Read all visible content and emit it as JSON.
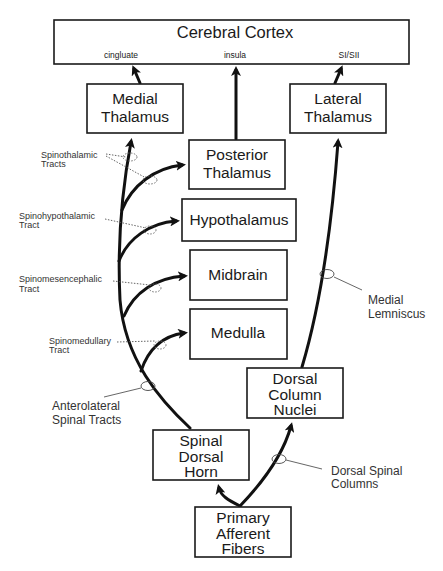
{
  "diagram": {
    "boxes": {
      "cortex": {
        "label": "Cerebral Cortex",
        "regions": [
          "cingluate",
          "insula",
          "SI/SII"
        ]
      },
      "medial_thalamus": {
        "lines": [
          "Medial",
          "Thalamus"
        ]
      },
      "lateral_thalamus": {
        "lines": [
          "Lateral",
          "Thalamus"
        ]
      },
      "posterior_thalamus": {
        "lines": [
          "Posterior",
          "Thalamus"
        ]
      },
      "hypothalamus": {
        "lines": [
          "Hypothalamus"
        ]
      },
      "midbrain": {
        "lines": [
          "Midbrain"
        ]
      },
      "medulla": {
        "lines": [
          "Medulla"
        ]
      },
      "dorsal_column_nuclei": {
        "lines": [
          "Dorsal",
          "Column",
          "Nuclei"
        ]
      },
      "spinal_dorsal_horn": {
        "lines": [
          "Spinal",
          "Dorsal",
          "Horn"
        ]
      },
      "primary_afferent": {
        "lines": [
          "Primary",
          "Afferent",
          "Fibers"
        ]
      }
    },
    "tract_labels": {
      "spinothalamic": [
        "Spinothalamic",
        "Tracts"
      ],
      "spinohypothalamic": [
        "Spinohypothalamic",
        "Tract"
      ],
      "spinomesencephalic": [
        "Spinomesencephalic",
        "Tract"
      ],
      "spinomedullary": [
        "Spinomedullary",
        "Tract"
      ]
    },
    "annotations": {
      "anterolateral": [
        "Anterolateral",
        "Spinal Tracts"
      ],
      "medial_lemniscus": [
        "Medial",
        "Lemniscus"
      ],
      "dorsal_columns": [
        "Dorsal Spinal",
        "Columns"
      ]
    }
  }
}
